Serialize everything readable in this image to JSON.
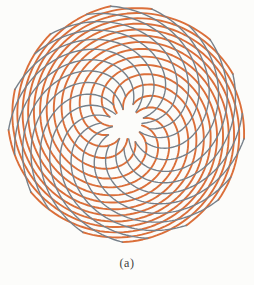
{
  "figure": {
    "caption": "(a)",
    "caption_color": "#3f3f3f",
    "background": "#fcfcfa",
    "center": {
      "x": 127,
      "y": 124
    },
    "inner_radius": 15,
    "outer_radius": 119,
    "scale": 6.25,
    "divergence_angle_deg": 137.508,
    "families": [
      {
        "name": "orange-clockwise-parastichies",
        "arm_count": 13,
        "color": "#db6f3a",
        "stroke_width": 1.9
      },
      {
        "name": "gray-counterclockwise-parastichies",
        "arm_count": 21,
        "color": "#76808a",
        "stroke_width": 1.4
      }
    ]
  }
}
